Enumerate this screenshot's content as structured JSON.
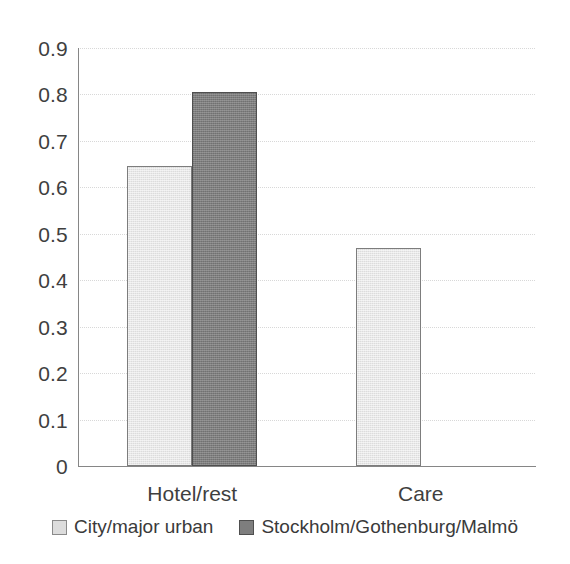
{
  "chart_data": {
    "type": "bar",
    "title": "",
    "subtitle": "",
    "xlabel": "",
    "ylabel": "",
    "categories": [
      "Hotel/rest",
      "Care"
    ],
    "series": [
      {
        "name": "City/major urban",
        "values": [
          0.645,
          0.47
        ],
        "color": "#dcdcdc",
        "border_color": "#7d7d7d"
      },
      {
        "name": "Stockholm/Gothenburg/Malmö",
        "values": [
          0.805,
          0
        ],
        "color": "#7e7e7e",
        "border_color": "#4f4f4f"
      }
    ],
    "ylim": [
      0,
      0.9
    ],
    "ytick_labels": [
      "0.9",
      "0.8",
      "0.7",
      "0.6",
      "0.5",
      "0.4",
      "0.3",
      "0.2",
      "0.1",
      "0"
    ],
    "ytick_values": [
      0.9,
      0.8,
      0.7,
      0.6,
      0.5,
      0.4,
      0.3,
      0.2,
      0.1,
      0
    ],
    "grid": true,
    "grid_axis": "y",
    "grid_color": "#d8d8d8",
    "legend_position": "bottom",
    "axis_color": "#868686",
    "background_color": "#ffffff"
  },
  "axis": {
    "y_labels": [
      "0.9",
      "0.8",
      "0.7",
      "0.6",
      "0.5",
      "0.4",
      "0.3",
      "0.2",
      "0.1",
      "0"
    ],
    "x_labels": [
      "Hotel/rest",
      "Care"
    ]
  },
  "legend": {
    "items": [
      {
        "label": "City/major urban",
        "swatch": "light-gray-square"
      },
      {
        "label": "Stockholm/Gothenburg/Malmö",
        "swatch": "dark-gray-square"
      }
    ]
  }
}
